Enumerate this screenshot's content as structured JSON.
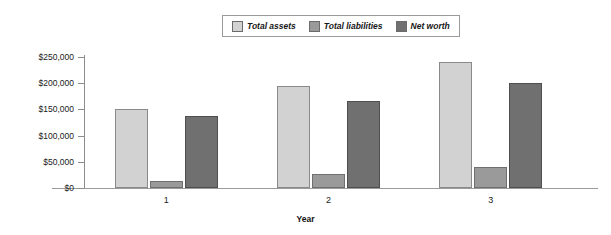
{
  "chart_data": {
    "type": "bar",
    "title": "",
    "xlabel": "Year",
    "ylabel": "",
    "categories": [
      "1",
      "2",
      "3"
    ],
    "series": [
      {
        "name": "Total assets",
        "color": "#d2d2d2",
        "values": [
          150000,
          194000,
          241000
        ]
      },
      {
        "name": "Total liabilities",
        "color": "#9a9a9a",
        "values": [
          13000,
          27000,
          40000
        ]
      },
      {
        "name": "Net worth",
        "color": "#707070",
        "values": [
          137000,
          167000,
          201000
        ]
      }
    ],
    "ylim": [
      0,
      250000
    ],
    "yticks": [
      0,
      50000,
      100000,
      150000,
      200000,
      250000
    ],
    "ytick_labels": [
      "$0",
      "$50,000",
      "$100,000",
      "$150,000",
      "$200,000",
      "$250,000"
    ],
    "grid": false,
    "legend_position": "top-center"
  },
  "legend": {
    "entries": [
      {
        "label": "Total assets"
      },
      {
        "label": "Total liabilities"
      },
      {
        "label": "Net worth"
      }
    ]
  },
  "axes": {
    "x_title": "Year",
    "x_tick_labels": [
      "1",
      "2",
      "3"
    ],
    "y_tick_labels": [
      "$250,000",
      "$200,000",
      "$150,000",
      "$100,000",
      "$50,000",
      "$0"
    ]
  }
}
